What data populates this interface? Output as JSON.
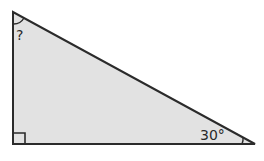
{
  "diagram": {
    "type": "right-triangle",
    "fill_color": "#e2e2e2",
    "stroke_color": "#2b2b2b",
    "vertices": {
      "top": [
        13,
        12
      ],
      "right_angle": [
        13,
        144
      ],
      "acute": [
        255,
        144
      ]
    },
    "labels": {
      "unknown_angle": "?",
      "known_angle": "30°"
    },
    "markers": {
      "right_angle": "square",
      "top_angle": "arc",
      "bottom_right_angle": "arc"
    }
  }
}
